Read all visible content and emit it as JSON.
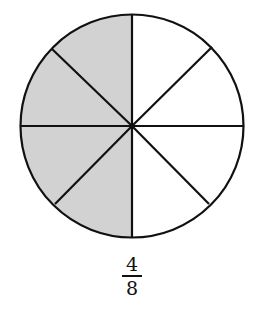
{
  "diagram": {
    "type": "fraction-circle",
    "total_parts": 8,
    "shaded_parts": 4,
    "shaded_side": "left",
    "colors": {
      "shaded": "#d2d2d2",
      "unshaded": "#ffffff",
      "stroke": "#111111"
    }
  },
  "fraction": {
    "numerator": "4",
    "denominator": "8"
  }
}
